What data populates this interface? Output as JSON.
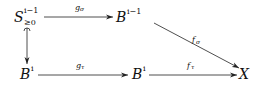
{
  "diagram": {
    "type": "commutative-diagram",
    "nodes": [
      {
        "id": "S",
        "base": "S",
        "sup": "i−1",
        "sub": "≥0"
      },
      {
        "id": "B_top",
        "base": "B",
        "sup": "i−1"
      },
      {
        "id": "B_left",
        "base": "B",
        "sup": "i"
      },
      {
        "id": "B_mid",
        "base": "B",
        "sup": "i"
      },
      {
        "id": "X",
        "base": "X"
      }
    ],
    "edges": [
      {
        "from": "S",
        "to": "B_top",
        "label": "g",
        "label_sub": "σ"
      },
      {
        "from": "S",
        "to": "B_left",
        "label": "",
        "style": "hook"
      },
      {
        "from": "B_left",
        "to": "B_mid",
        "label": "g",
        "label_sub": "τ"
      },
      {
        "from": "B_top",
        "to": "X",
        "label": "f",
        "label_sub": "σ"
      },
      {
        "from": "B_mid",
        "to": "X",
        "label": "f",
        "label_sub": "τ"
      }
    ]
  }
}
